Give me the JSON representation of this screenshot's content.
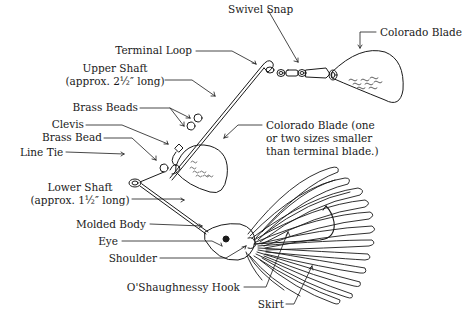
{
  "diagram": {
    "ink_color": "#1a1a1a",
    "background_color": "#ffffff",
    "labels": {
      "swivel_snap": "Swivel Snap",
      "colorado_blade_terminal": "Colorado Blade",
      "terminal_loop": "Terminal Loop",
      "upper_shaft_line1": "Upper Shaft",
      "upper_shaft_line2": "(approx. 2½″ long)",
      "brass_beads": "Brass Beads",
      "clevis": "Clevis",
      "brass_bead": "Brass Bead",
      "line_tie": "Line Tie",
      "colorado_blade_small_line1": "Colorado Blade (one",
      "colorado_blade_small_line2": "or two sizes smaller",
      "colorado_blade_small_line3": "than terminal blade.)",
      "lower_shaft_line1": "Lower Shaft",
      "lower_shaft_line2": "(approx. 1½″ long)",
      "molded_body": "Molded Body",
      "eye": "Eye",
      "shoulder": "Shoulder",
      "hook": "O'Shaughnessy Hook",
      "skirt": "Skirt"
    }
  }
}
